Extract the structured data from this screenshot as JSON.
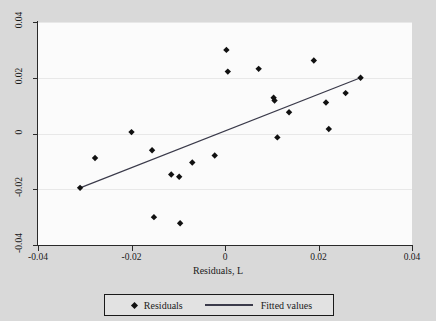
{
  "chart_data": {
    "type": "scatter",
    "title": "",
    "xlabel": "Residuals, L",
    "ylabel": "",
    "xlim": [
      -0.04,
      0.04
    ],
    "ylim": [
      -0.04,
      0.04
    ],
    "xticks": [
      "-0.04",
      "-0.02",
      "0",
      "0.02",
      "0.04"
    ],
    "xtick_values": [
      -0.04,
      -0.02,
      0,
      0.02,
      0.04
    ],
    "yticks": [
      "0.04",
      "0.02",
      "0",
      "-0.02",
      "-0.04"
    ],
    "ytick_values": [
      0.04,
      0.02,
      0,
      -0.02,
      -0.04
    ],
    "grid": "horizontal",
    "legend_position": "below",
    "series": [
      {
        "name": "Residuals",
        "type": "scatter",
        "marker": "diamond",
        "color": "#111111",
        "points": [
          {
            "x": -0.031,
            "y": -0.0195
          },
          {
            "x": -0.0278,
            "y": -0.0088
          },
          {
            "x": -0.02,
            "y": 0.0005
          },
          {
            "x": -0.0156,
            "y": -0.006
          },
          {
            "x": -0.0152,
            "y": -0.03
          },
          {
            "x": -0.0115,
            "y": -0.0147
          },
          {
            "x": -0.0098,
            "y": -0.0155
          },
          {
            "x": -0.0096,
            "y": -0.0322
          },
          {
            "x": -0.007,
            "y": -0.0104
          },
          {
            "x": -0.0022,
            "y": -0.0079
          },
          {
            "x": 0.0003,
            "y": 0.03
          },
          {
            "x": 0.0006,
            "y": 0.0222
          },
          {
            "x": 0.0072,
            "y": 0.0232
          },
          {
            "x": 0.0104,
            "y": 0.0128
          },
          {
            "x": 0.0106,
            "y": 0.0118
          },
          {
            "x": 0.0112,
            "y": -0.0014
          },
          {
            "x": 0.0137,
            "y": 0.0076
          },
          {
            "x": 0.019,
            "y": 0.0262
          },
          {
            "x": 0.0216,
            "y": 0.0111
          },
          {
            "x": 0.0222,
            "y": 0.0016
          },
          {
            "x": 0.0258,
            "y": 0.0145
          },
          {
            "x": 0.029,
            "y": 0.02
          }
        ]
      },
      {
        "name": "Fitted values",
        "type": "line",
        "color": "#3a3a4a",
        "points": [
          {
            "x": -0.031,
            "y": -0.0195
          },
          {
            "x": 0.029,
            "y": 0.02
          }
        ]
      }
    ]
  },
  "legend": {
    "residuals_label": "Residuals",
    "fitted_label": "Fitted values"
  },
  "axis": {
    "x_title": "Residuals, L"
  }
}
